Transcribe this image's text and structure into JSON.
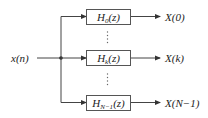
{
  "diagram": {
    "type": "filter-bank block diagram",
    "input": {
      "label": "x(n)",
      "var": "x",
      "arg": "n"
    },
    "filters": [
      {
        "name": "H",
        "subscript": "0",
        "arg": "(z)",
        "output": "X(0)"
      },
      {
        "name": "H",
        "subscript": "k",
        "arg": "(z)",
        "output": "X(k)"
      },
      {
        "name": "H",
        "subscript": "N−1",
        "arg": "(z)",
        "output": "X(N−1)"
      }
    ],
    "ellipsis": "⋮",
    "colors": {
      "line": "#444444",
      "box_border": "#555555",
      "text": "#222222"
    }
  }
}
